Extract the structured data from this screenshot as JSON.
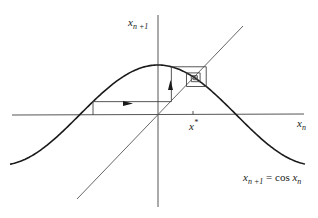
{
  "chart_data": {
    "type": "line",
    "xlabel": "x_n",
    "ylabel": "x_{n+1}",
    "grid": false,
    "legend": "none",
    "xlim": [
      -2.96,
      2.94
    ],
    "ylim": [
      -1.84,
      2.3
    ],
    "series": [
      {
        "name": "cos curve",
        "function": "y = cos(x)",
        "x_range": [
          -2.96,
          2.94
        ]
      },
      {
        "name": "diagonal",
        "function": "y = x",
        "x_range": [
          -1.62,
          1.7
        ]
      },
      {
        "name": "cobweb",
        "x0": -1.3,
        "iterations": 8,
        "fixed_point": 0.739
      }
    ],
    "annotations": [
      {
        "text": "x*",
        "x": 0.739,
        "note": "fixed point tick on x-axis"
      },
      {
        "text": "arrow right",
        "on": "first horizontal cobweb segment"
      },
      {
        "text": "arrow up",
        "on": "first vertical cobweb segment"
      }
    ]
  },
  "labels": {
    "y_axis_base": "x",
    "y_axis_sub": "n +1",
    "x_axis_base": "x",
    "x_axis_sub": "n",
    "fixed_point_base": "x",
    "fixed_point_sup": "*",
    "equation_lhs_base": "x",
    "equation_lhs_sub": "n +1",
    "equation_eq": " = cos ",
    "equation_rhs_base": "x",
    "equation_rhs_sub": "n"
  },
  "geometry": {
    "origin_x": 158,
    "origin_y": 115,
    "scale": 50,
    "stroke_color": "#1a1a1a",
    "axis_color": "#555555"
  }
}
